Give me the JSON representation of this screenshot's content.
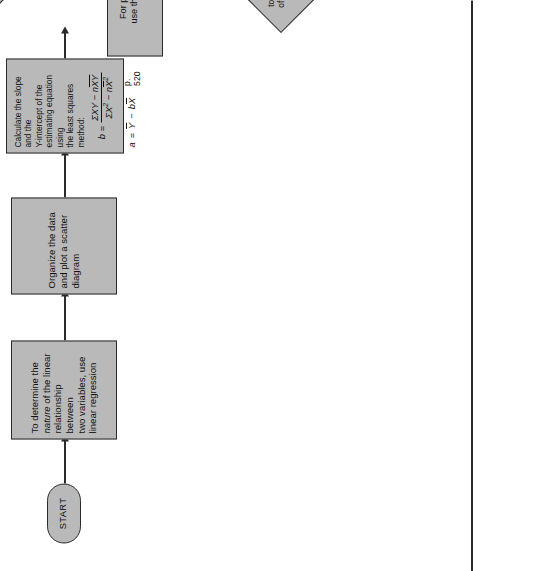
{
  "page": {
    "orientation": "rotated-90-ccw",
    "background_color": "#ffffff",
    "node_fill_color": "#b9b9b9",
    "node_border_color": "#2b2b2b",
    "text_color": "#111111"
  },
  "nodes": {
    "start": {
      "id": "start",
      "type": "terminator",
      "label": "START"
    },
    "determine_nature": {
      "id": "determine-nature",
      "type": "process",
      "line1": "To determine the",
      "line2_italic": "nature",
      "line2_rest": " of the linear",
      "line3": "relationship between",
      "line4": "two variables, use",
      "line5": "linear regression"
    },
    "organize_data": {
      "id": "organize-data",
      "type": "process",
      "line1": "Organize the data",
      "line2": "and plot a scatter",
      "line3": "diagram"
    },
    "calculate_slope": {
      "id": "calculate-slope",
      "type": "process",
      "line1": "Calculate the slope and the",
      "line2": "Y-intercept of the",
      "line3": "estimating equation using",
      "line4": "the least squares method:",
      "formula_b_lhs": "b",
      "formula_b_eq": "=",
      "formula_b_numerator": "ΣXY − nXY",
      "formula_b_denominator": "ΣX² − nX²",
      "formula_a": "a  =  Y − bX",
      "page_ref": "p. 520"
    },
    "decision_predict": {
      "id": "decision-predict-values",
      "type": "decision",
      "line1": "Do you want",
      "line2": "to predict values",
      "line3": "of the dependent",
      "line4": "variable, Y",
      "line5": "?"
    },
    "point_predictions": {
      "id": "point-predictions",
      "type": "process",
      "line1": "For point predictions,",
      "line2": "use the regression line:",
      "formula": "Ŷ = a + bX"
    },
    "decision_interval": {
      "id": "decision-prediction-interval",
      "type": "decision",
      "line1": "Do you want an",
      "line2": "approximate prediction",
      "line3": "interval for Y",
      "line4": "?"
    }
  },
  "edges": {
    "start_to_determine": {
      "label": ""
    },
    "determine_to_organize": {
      "label": ""
    },
    "organize_to_calculate": {
      "label": ""
    },
    "calculate_to_decision": {
      "label": ""
    },
    "decision_predict_yes": {
      "label": "Yes"
    },
    "decision_predict_no": {
      "label": "No"
    },
    "point_to_decision_interval": {
      "label": ""
    },
    "decision_interval_yes": {
      "label": "Yes"
    },
    "decision_interval_no": {
      "label": "No"
    }
  }
}
